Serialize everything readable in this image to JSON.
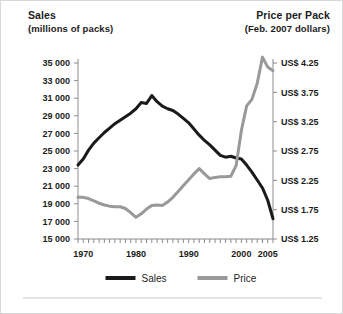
{
  "header": {
    "left_title": "Sales",
    "left_subtitle": "(millions of packs)",
    "right_title": "Price per Pack",
    "right_subtitle": "(Feb. 2007 dollars)"
  },
  "colors": {
    "sales": "#1a1a1a",
    "price": "#999999",
    "axis": "#8c8c8c",
    "text": "#1c1c1c",
    "background": "#ffffff",
    "border": "#d8d8d8"
  },
  "legend": {
    "position": "bottom-center",
    "entries": [
      {
        "label": "Sales",
        "color": "#1a1a1a"
      },
      {
        "label": "Price",
        "color": "#999999"
      }
    ]
  },
  "chart_data": {
    "type": "line",
    "title": "",
    "subtitle": "",
    "xlabel": "",
    "ylabel": "Sales (millions of packs)",
    "y2label": "Price per Pack (Feb. 2007 dollars)",
    "grid": false,
    "xlim": [
      1969,
      2006
    ],
    "ylim": [
      15000,
      35000
    ],
    "y2lim": [
      1.25,
      4.25
    ],
    "yticks": [
      15000,
      17000,
      19000,
      21000,
      23000,
      25000,
      27000,
      29000,
      31000,
      33000,
      35000
    ],
    "ytick_labels": [
      "15 000",
      "17 000",
      "19 000",
      "21 000",
      "23 000",
      "25 000",
      "27 000",
      "29 000",
      "31 000",
      "33 000",
      "35 000"
    ],
    "y2ticks": [
      1.25,
      1.75,
      2.25,
      2.75,
      3.25,
      3.75,
      4.25
    ],
    "y2tick_labels": [
      "US$ 1.25",
      "US$ 1.75",
      "US$ 2.25",
      "US$ 2.75",
      "US$ 3.25",
      "US$ 3.75",
      "US$ 4.25"
    ],
    "xticks": [
      1970,
      1980,
      1990,
      2000,
      2005
    ],
    "xtick_labels": [
      "1970",
      "1980",
      "1990",
      "2000",
      "2005"
    ],
    "x_minor_tick_step": 1,
    "x": [
      1969,
      1970,
      1971,
      1972,
      1973,
      1974,
      1975,
      1976,
      1977,
      1978,
      1979,
      1980,
      1981,
      1982,
      1983,
      1984,
      1985,
      1986,
      1987,
      1988,
      1989,
      1990,
      1991,
      1992,
      1993,
      1994,
      1995,
      1996,
      1997,
      1998,
      1999,
      2000,
      2001,
      2002,
      2003,
      2004,
      2005,
      2006
    ],
    "series": [
      {
        "name": "Sales",
        "axis": "left",
        "color": "#1a1a1a",
        "units": "millions of packs",
        "values": [
          23400,
          24100,
          25100,
          25900,
          26500,
          27100,
          27600,
          28100,
          28500,
          28900,
          29300,
          29800,
          30500,
          30400,
          31300,
          30600,
          30100,
          29800,
          29600,
          29200,
          28700,
          28200,
          27500,
          26800,
          26200,
          25700,
          25100,
          24500,
          24300,
          24400,
          24200,
          24100,
          23400,
          22600,
          21700,
          20800,
          19400,
          17300
        ]
      },
      {
        "name": "Price",
        "axis": "right",
        "color": "#999999",
        "units": "US$ (Feb. 2007 dollars)",
        "values": [
          1.96,
          1.96,
          1.94,
          1.9,
          1.86,
          1.83,
          1.81,
          1.8,
          1.8,
          1.77,
          1.7,
          1.62,
          1.68,
          1.76,
          1.82,
          1.83,
          1.82,
          1.88,
          1.96,
          2.06,
          2.16,
          2.26,
          2.36,
          2.45,
          2.36,
          2.28,
          2.3,
          2.31,
          2.31,
          2.32,
          2.5,
          3.1,
          3.52,
          3.63,
          3.9,
          4.35,
          4.18,
          4.12
        ]
      }
    ]
  }
}
